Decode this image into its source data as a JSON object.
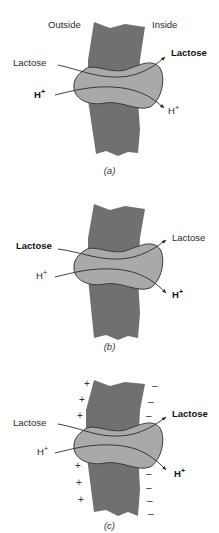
{
  "colors": {
    "membrane": "#707070",
    "transporter": "#a9a9a9",
    "outline": "#3a3a3a",
    "text": "#222222"
  },
  "headers": {
    "outside": "Outside",
    "inside": "Inside"
  },
  "panels": [
    {
      "caption": "(a)",
      "left_top": {
        "text": "Lactose",
        "bold": false
      },
      "left_bottom": {
        "text": "H",
        "sup": "+",
        "bold": true
      },
      "right_top": {
        "text": "Lactose",
        "bold": true
      },
      "right_bottom": {
        "text": "H",
        "sup": "+",
        "bold": false
      }
    },
    {
      "caption": "(b)",
      "left_top": {
        "text": "Lactose",
        "bold": true
      },
      "left_bottom": {
        "text": "H",
        "sup": "+",
        "bold": false
      },
      "right_top": {
        "text": "Lactose",
        "bold": false
      },
      "right_bottom": {
        "text": "H",
        "sup": "+",
        "bold": true
      }
    },
    {
      "caption": "(c)",
      "left_top": {
        "text": "Lactose",
        "bold": false
      },
      "left_bottom": {
        "text": "H",
        "sup": "+",
        "bold": false
      },
      "right_top": {
        "text": "Lactose",
        "bold": true
      },
      "right_bottom": {
        "text": "H",
        "sup": "+",
        "bold": true
      },
      "outside_charge": "+",
      "inside_charge": "–"
    }
  ]
}
